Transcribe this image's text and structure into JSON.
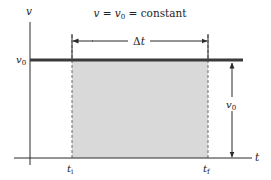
{
  "title": {
    "lhs": "v",
    "eq1": " = ",
    "mid": "v",
    "mid_sub": "0",
    "eq2": " = ",
    "rhs": "constant"
  },
  "axes": {
    "y_label": "v",
    "x_label": "t"
  },
  "level": {
    "label": "v",
    "label_sub": "0"
  },
  "interval": {
    "label_delta": "Δ",
    "label_t": "t",
    "start_label": "t",
    "start_sub": "i",
    "end_label": "t",
    "end_sub": "f"
  },
  "height_marker": {
    "label": "v",
    "label_sub": "0"
  },
  "colors": {
    "line": "#2b2b2b",
    "thick_line": "#3a3a3a",
    "fill": "#d9d9d9",
    "dashed": "#6a6a6a",
    "text": "#222222"
  }
}
